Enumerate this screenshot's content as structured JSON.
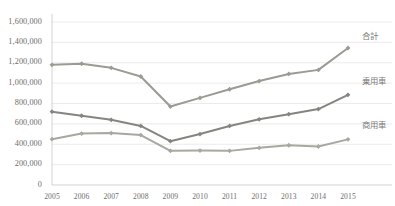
{
  "chart_data": {
    "type": "line",
    "title": "",
    "subtitle": "",
    "xlabel": "",
    "ylabel": "",
    "categories": [
      "2005",
      "2006",
      "2007",
      "2008",
      "2009",
      "2010",
      "2011",
      "2012",
      "2013",
      "2014",
      "2015"
    ],
    "ylim": [
      0,
      1600000
    ],
    "ytick_labels": [
      "1,600,000",
      "1,400,000",
      "1,200,000",
      "1,000,000",
      "800,000",
      "600,000",
      "400,000",
      "200,000",
      "0"
    ],
    "ytick_values": [
      1600000,
      1400000,
      1200000,
      1000000,
      800000,
      600000,
      400000,
      200000,
      0
    ],
    "ytick_step": 200000,
    "grid": true,
    "grid_axis": "y",
    "legend_position": "inline-right",
    "series": [
      {
        "name": "合計",
        "color": "#9b9b93",
        "marker": "diamond",
        "values": [
          1180000,
          1190000,
          1150000,
          1065000,
          770000,
          855000,
          940000,
          1020000,
          1090000,
          1130000,
          1345000
        ]
      },
      {
        "name": "乗用車",
        "color": "#858580",
        "marker": "diamond",
        "values": [
          720000,
          680000,
          640000,
          580000,
          430000,
          500000,
          580000,
          645000,
          695000,
          745000,
          885000
        ]
      },
      {
        "name": "商用車",
        "color": "#a8a8a0",
        "marker": "diamond",
        "values": [
          450000,
          505000,
          510000,
          490000,
          335000,
          338000,
          335000,
          365000,
          390000,
          378000,
          448000
        ]
      }
    ]
  },
  "style": {
    "background": "#ffffff",
    "grid_color": "#e2e2e2",
    "axis_color": "#c8c8c8",
    "tick_text_color": "#6d6d6d",
    "series_label_color": "#7a7a7a"
  }
}
